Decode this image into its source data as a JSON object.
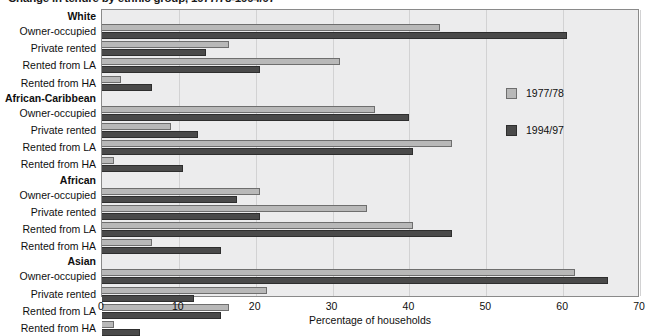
{
  "chart_data": {
    "type": "bar",
    "orientation": "horizontal",
    "title": "Change in tenure by ethnic group, 1977/78-1994/97",
    "xlabel": "Percentage of households",
    "ylabel": "",
    "xlim": [
      0,
      70
    ],
    "xticks": [
      0,
      10,
      20,
      30,
      40,
      50,
      60,
      70
    ],
    "grid": true,
    "legend_position": "right",
    "legend": [
      "1977/78",
      "1994/97"
    ],
    "colors": {
      "series_1977_78": "#b8b8b8",
      "series_1994_97": "#4a4a4a",
      "plot_background": "#ececed",
      "frame": "#8a8a8a"
    },
    "series": [
      {
        "name": "1977/78",
        "values": [
          44.0,
          16.5,
          31.0,
          2.5,
          35.5,
          9.0,
          45.5,
          1.5,
          20.5,
          34.5,
          40.5,
          6.5,
          61.5,
          21.5,
          16.5,
          1.5
        ]
      },
      {
        "name": "1994/97",
        "values": [
          60.5,
          13.5,
          20.5,
          6.5,
          40.0,
          12.5,
          40.5,
          10.5,
          17.5,
          20.5,
          45.5,
          15.5,
          65.9,
          12.0,
          15.5,
          5.0
        ]
      }
    ],
    "groups": [
      {
        "label": "White",
        "rows": [
          {
            "label": "Owner-occupied",
            "v1977": 44.0,
            "v1994": 60.5
          },
          {
            "label": "Private rented",
            "v1977": 16.5,
            "v1994": 13.5
          },
          {
            "label": "Rented from LA",
            "v1977": 31.0,
            "v1994": 20.5
          },
          {
            "label": "Rented from HA",
            "v1977": 2.5,
            "v1994": 6.5
          }
        ]
      },
      {
        "label": "African-Caribbean",
        "rows": [
          {
            "label": "Owner-occupied",
            "v1977": 35.5,
            "v1994": 40.0
          },
          {
            "label": "Private rented",
            "v1977": 9.0,
            "v1994": 12.5
          },
          {
            "label": "Rented from LA",
            "v1977": 45.5,
            "v1994": 40.5
          },
          {
            "label": "Rented from HA",
            "v1977": 1.5,
            "v1994": 10.5
          }
        ]
      },
      {
        "label": "African",
        "rows": [
          {
            "label": "Owner-occupied",
            "v1977": 20.5,
            "v1994": 17.5
          },
          {
            "label": "Private rented",
            "v1977": 34.5,
            "v1994": 20.5
          },
          {
            "label": "Rented from LA",
            "v1977": 40.5,
            "v1994": 45.5
          },
          {
            "label": "Rented from HA",
            "v1977": 6.5,
            "v1994": 15.5
          }
        ]
      },
      {
        "label": "Asian",
        "rows": [
          {
            "label": "Owner-occupied",
            "v1977": 61.5,
            "v1994": 65.9
          },
          {
            "label": "Private rented",
            "v1977": 21.5,
            "v1994": 12.0
          },
          {
            "label": "Rented from LA",
            "v1977": 16.5,
            "v1994": 15.5
          },
          {
            "label": "Rented from HA",
            "v1977": 1.5,
            "v1994": 5.0
          }
        ]
      }
    ]
  }
}
